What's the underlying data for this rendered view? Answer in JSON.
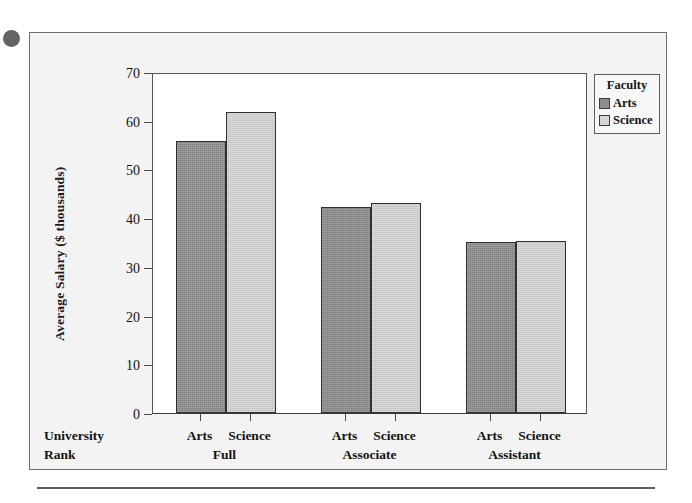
{
  "figure": {
    "background_color": "#f3f3f3",
    "frame_color": "#6d6d6d",
    "plot_background": "#ffffff"
  },
  "legend": {
    "title": "Faculty",
    "position": "top-right inside plot",
    "entries": [
      {
        "label": "Arts",
        "color": "#8d8d8d"
      },
      {
        "label": "Science",
        "color": "#d5d5d5"
      }
    ]
  },
  "axis": {
    "y_title": "Average Salary ($ thousands)",
    "y_ticks": [
      "70",
      "60",
      "50",
      "40",
      "30",
      "20",
      "10",
      "0"
    ],
    "x_corner_line1": "University",
    "x_corner_line2": "Rank"
  },
  "groups": [
    {
      "rank": "Full",
      "bars": [
        {
          "faculty": "Arts",
          "value": 55.8
        },
        {
          "faculty": "Science",
          "value": 61.8
        }
      ]
    },
    {
      "rank": "Associate",
      "bars": [
        {
          "faculty": "Arts",
          "value": 42.2
        },
        {
          "faculty": "Science",
          "value": 43.2
        }
      ]
    },
    {
      "rank": "Assistant",
      "bars": [
        {
          "faculty": "Arts",
          "value": 35.2
        },
        {
          "faculty": "Science",
          "value": 35.4
        }
      ]
    }
  ],
  "chart_data": {
    "type": "bar",
    "title": "",
    "subtitle": "",
    "xlabel": "University Rank",
    "ylabel": "Average Salary ($ thousands)",
    "categories": [
      "Full",
      "Associate",
      "Assistant"
    ],
    "series": [
      {
        "name": "Arts",
        "color": "#8d8d8d",
        "values": [
          55.8,
          42.2,
          35.2
        ]
      },
      {
        "name": "Science",
        "color": "#d5d5d5",
        "values": [
          61.8,
          43.2,
          35.4
        ]
      }
    ],
    "ylim": [
      0,
      70
    ],
    "ytick_step": 10,
    "yticks": [
      0,
      10,
      20,
      30,
      40,
      50,
      60,
      70
    ],
    "xtick_labels": [
      "Arts",
      "Science",
      "Arts",
      "Science",
      "Arts",
      "Science"
    ],
    "grid": false,
    "legend": {
      "title": "Faculty",
      "position": "top-right",
      "entries": [
        "Arts",
        "Science"
      ]
    },
    "grouping": "clustered by rank, two faculty bars per rank",
    "annotations": []
  }
}
